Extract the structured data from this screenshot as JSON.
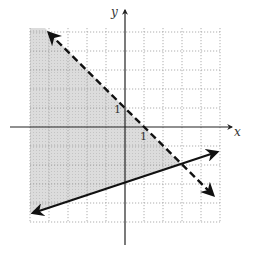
{
  "graph": {
    "x_axis_label": "x",
    "y_axis_label": "y",
    "tick_x_label": "1",
    "tick_y_label": "1",
    "x_range": [
      -5,
      5
    ],
    "y_range": [
      -5,
      5
    ],
    "grid": "dotted, 1 unit",
    "colors": {
      "shade": "#d9d9d9",
      "lines": "#111111",
      "grid": "#9a9a9a"
    }
  },
  "boundaries": [
    {
      "name": "dashed-boundary",
      "equation": "y = -x + 1",
      "style": "dashed",
      "inclusive": false
    },
    {
      "name": "solid-boundary",
      "equation": "y = (1/3)x - 3",
      "style": "solid",
      "inclusive": true
    }
  ],
  "solution_region": "y < -x + 1 and y >= (1/3)x - 3",
  "intersection": [
    3,
    -2
  ]
}
